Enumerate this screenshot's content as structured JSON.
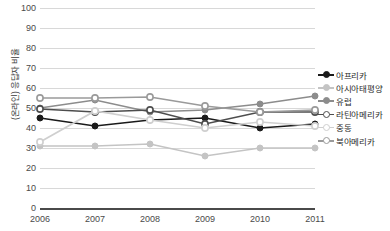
{
  "chart_data": {
    "type": "line",
    "title": "",
    "xlabel": "",
    "ylabel": "(온라인) 응답자 비율",
    "x": [
      "2006",
      "2007",
      "2008",
      "2009",
      "2010",
      "2011"
    ],
    "categories": [
      "2006",
      "2007",
      "2008",
      "2009",
      "2010",
      "2011"
    ],
    "ylim": [
      0,
      100
    ],
    "yticks": [
      "0",
      "10",
      "20",
      "30",
      "40",
      "50",
      "60",
      "70",
      "80",
      "90",
      "100"
    ],
    "grid": true,
    "legend_position": "right",
    "series": [
      {
        "name": "아프리카",
        "color": "#1a1a1a",
        "marker": "filled-circle",
        "values": [
          45,
          41,
          44,
          45,
          40,
          42
        ]
      },
      {
        "name": "아시아태평양",
        "color": "#c4c4c4",
        "marker": "filled-circle",
        "values": [
          31,
          31,
          32,
          26,
          30,
          30
        ]
      },
      {
        "name": "유럽",
        "color": "#8c8c8c",
        "marker": "filled-circle",
        "values": [
          50,
          54,
          48,
          49,
          52,
          56
        ]
      },
      {
        "name": "라틴아메리카",
        "color": "#4d4d4d",
        "marker": "open-circle",
        "values": [
          49.5,
          48,
          49,
          42,
          48,
          48
        ]
      },
      {
        "name": "중동",
        "color": "#cfcfcf",
        "marker": "open-circle",
        "values": [
          33,
          48.5,
          44,
          40,
          43,
          41
        ]
      },
      {
        "name": "북아메리카",
        "color": "#9a9a9a",
        "marker": "open-circle",
        "values": [
          55,
          55,
          55.5,
          51,
          48,
          49
        ]
      }
    ]
  }
}
